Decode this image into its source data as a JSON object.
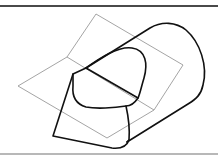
{
  "figure": {
    "colors": {
      "solid_stroke": "#111111",
      "plane_stroke": "#9a9a9a",
      "top_rule": "#4a4a4a",
      "bottom_rule": "#b8b8b8",
      "background": "#ffffff"
    },
    "elements": [
      {
        "name": "folded-plane",
        "style": "thin gray"
      },
      {
        "name": "cylinder-body",
        "style": "thick black"
      },
      {
        "name": "intersection-curve",
        "style": "thick black"
      },
      {
        "name": "cut-face",
        "style": "thick black"
      }
    ]
  }
}
